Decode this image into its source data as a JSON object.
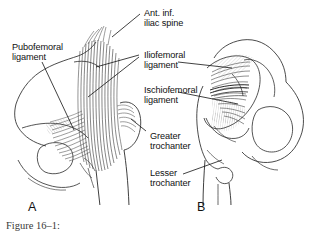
{
  "figure": {
    "caption": "Figure 16–1:",
    "background_color": "#ffffff",
    "ink_color": "#1a1a1a",
    "labels": [
      {
        "id": "ant-inf-iliac-spine",
        "line1": "Ant. inf.",
        "line2": "iliac spine"
      },
      {
        "id": "pubofemoral-ligament",
        "line1": "Pubofemoral",
        "line2": "ligament"
      },
      {
        "id": "iliofemoral-ligament",
        "line1": "Iliofemoral",
        "line2": "ligament"
      },
      {
        "id": "ischiofemoral-ligament",
        "line1": "Ischiofemoral",
        "line2": "ligament"
      },
      {
        "id": "greater-trochanter",
        "line1": "Greater",
        "line2": "trochanter"
      },
      {
        "id": "lesser-trochanter",
        "line1": "Lesser",
        "line2": "trochanter"
      }
    ],
    "panels": [
      {
        "id": "panel-a",
        "letter": "A",
        "view": "anterior hip with pubofemoral and iliofemoral ligaments"
      },
      {
        "id": "panel-b",
        "letter": "B",
        "view": "posterior hip with ischiofemoral and iliofemoral ligaments"
      }
    ]
  }
}
